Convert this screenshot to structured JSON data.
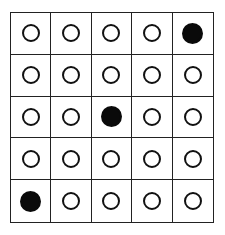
{
  "grid": {
    "rows": 5,
    "cols": 5,
    "colors": {
      "line": "#222222",
      "filled": "#0a0a0a",
      "empty_fill": "#ffffff"
    },
    "cells": [
      [
        "empty",
        "empty",
        "empty",
        "empty",
        "filled"
      ],
      [
        "empty",
        "empty",
        "empty",
        "empty",
        "empty"
      ],
      [
        "empty",
        "empty",
        "filled",
        "empty",
        "empty"
      ],
      [
        "empty",
        "empty",
        "empty",
        "empty",
        "empty"
      ],
      [
        "filled",
        "empty",
        "empty",
        "empty",
        "empty"
      ]
    ],
    "filled_positions": [
      {
        "row": 1,
        "col": 5
      },
      {
        "row": 3,
        "col": 3
      },
      {
        "row": 5,
        "col": 1
      }
    ]
  }
}
